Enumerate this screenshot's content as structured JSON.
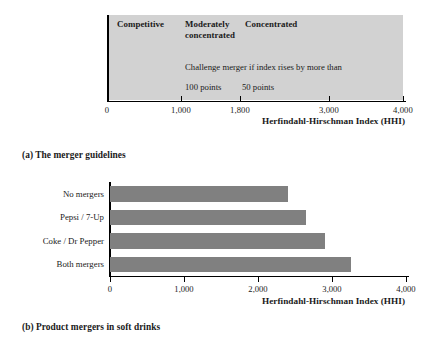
{
  "figure": {
    "panel_a": {
      "caption": "(a) The merger guidelines",
      "axis_title": "Herfindahl-Hirschman Index (HHI)",
      "band_color": "#d2d2d2",
      "zones": [
        {
          "label": "Competitive",
          "x": 1000
        },
        {
          "label": "Moderately",
          "x": 1800
        },
        {
          "label": "concentrated",
          "x": 1800
        },
        {
          "label": "Concentrated",
          "x": 4000
        }
      ],
      "note_line": "Challenge merger if index rises by more than",
      "thresholds": [
        {
          "label": "100 points"
        },
        {
          "label": "50 points"
        }
      ],
      "ticks": [
        0,
        1000,
        1800,
        3000,
        4000
      ],
      "tick_labels": [
        "0",
        "1,000",
        "1,800",
        "3,000",
        "4,000"
      ],
      "xlim": [
        0,
        4000
      ]
    },
    "panel_b": {
      "caption": "(b) Product mergers in soft drinks",
      "axis_title": "Herfindahl-Hirschman Index (HHI)",
      "ticks": [
        0,
        1000,
        2000,
        3000,
        4000
      ],
      "tick_labels": [
        "0",
        "1,000",
        "2,000",
        "3,000",
        "4,000"
      ],
      "xlim": [
        0,
        4000
      ],
      "bar_color": "#808080"
    }
  },
  "chart_data": [
    {
      "type": "table",
      "title": "The merger guidelines",
      "xlabel": "Herfindahl-Hirschman Index (HHI)",
      "ylabel": "",
      "xlim": [
        0,
        4000
      ],
      "grid": false,
      "legend": "none",
      "annotations": [
        "Competitive",
        "Moderately concentrated",
        "Concentrated",
        "Challenge merger if index rises by more than",
        "100 points",
        "50 points"
      ],
      "zone_boundaries": [
        0,
        1000,
        1800,
        4000
      ],
      "zone_names": [
        "Competitive",
        "Moderately concentrated",
        "Concentrated"
      ],
      "zone_challenge_thresholds": [
        null,
        100,
        50
      ],
      "tick_values": [
        0,
        1000,
        1800,
        3000,
        4000
      ],
      "tick_labels": [
        "0",
        "1,000",
        "1,800",
        "3,000",
        "4,000"
      ]
    },
    {
      "type": "bar",
      "orientation": "horizontal",
      "title": "Product mergers in soft drinks",
      "xlabel": "Herfindahl-Hirschman Index (HHI)",
      "ylabel": "",
      "xlim": [
        0,
        4000
      ],
      "grid": false,
      "legend": "none",
      "categories": [
        "No mergers",
        "Pepsi / 7-Up",
        "Coke / Dr Pepper",
        "Both mergers"
      ],
      "values": [
        2400,
        2650,
        2900,
        3250
      ],
      "tick_values": [
        0,
        1000,
        2000,
        3000,
        4000
      ],
      "tick_labels": [
        "0",
        "1,000",
        "2,000",
        "3,000",
        "4,000"
      ]
    }
  ]
}
